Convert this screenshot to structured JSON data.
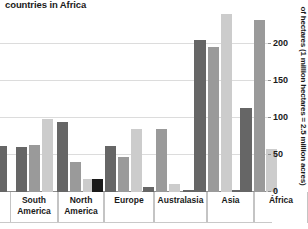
{
  "title": "countries in Africa",
  "y_axis_title": "of hectares (1 million hectares = 2.5 million acres)",
  "y_ticks": [
    "0",
    "50",
    "100",
    "150",
    "200"
  ],
  "categories": [
    "South\nAmerica",
    "North\nAmerica",
    "Europe",
    "Australasia",
    "Asia",
    "África"
  ],
  "colors": {
    "series_1": "#1a1a1a",
    "series_2": "#666666",
    "series_3": "#9a9a9a",
    "series_4": "#cccccc",
    "gridline": "#dcdcdc",
    "baseline": "#8c8c8c",
    "background": "#ffffff",
    "text": "#1a1a1a"
  },
  "chart_data": {
    "type": "bar",
    "title": "countries in Africa",
    "xlabel": "",
    "ylabel": "of hectares (1 million hectares = 2.5 million acres)",
    "ylim": [
      0,
      215
    ],
    "yticks": [
      0,
      50,
      100,
      150,
      200
    ],
    "grid": true,
    "legend": "none",
    "clipped_note": "Chart is cropped: title truncated at top, leftmost bar partially cut off at left edge, tallest Asia and África bars extend beyond top crop.",
    "categories": [
      "South America",
      "North America",
      "Europe",
      "Australasia",
      "Asia",
      "África"
    ],
    "series": [
      {
        "name": "Series 1",
        "color": "#1a1a1a",
        "values": [
          null,
          null,
          18,
          null,
          null,
          null
        ]
      },
      {
        "name": "Series 2",
        "color": "#666666",
        "values": [
          61,
          94,
          62,
          7,
          205,
          113
        ]
      },
      {
        "name": "Series 3",
        "color": "#9a9a9a",
        "values": [
          64,
          40,
          47,
          85,
          196,
          232
        ]
      },
      {
        "name": "Series 4",
        "color": "#cccccc",
        "values": [
          99,
          18,
          85,
          11,
          240,
          58
        ]
      }
    ],
    "bars": [
      {
        "group": "left-clipped",
        "series": "Series 2",
        "value": 62,
        "x": -4,
        "width": 11,
        "color": "#666666"
      },
      {
        "group": "South America",
        "series": "Series 2",
        "value": 61,
        "x": 16,
        "width": 11,
        "color": "#666666"
      },
      {
        "group": "South America",
        "series": "Series 3",
        "value": 64,
        "x": 29,
        "width": 11,
        "color": "#9a9a9a"
      },
      {
        "group": "South America",
        "series": "Series 4",
        "value": 99,
        "x": 42,
        "width": 11,
        "color": "#cccccc"
      },
      {
        "group": "North America",
        "series": "Series 2",
        "value": 94,
        "x": 57,
        "width": 11,
        "color": "#666666"
      },
      {
        "group": "North America",
        "series": "Series 3",
        "value": 40,
        "x": 70,
        "width": 11,
        "color": "#9a9a9a"
      },
      {
        "group": "North America",
        "series": "Series 4",
        "value": 18,
        "x": 83,
        "width": 11,
        "color": "#cccccc"
      },
      {
        "group": "Europe",
        "series": "Series 1",
        "value": 18,
        "x": 92,
        "width": 11,
        "color": "#1a1a1a"
      },
      {
        "group": "Europe",
        "series": "Series 2",
        "value": 62,
        "x": 105,
        "width": 11,
        "color": "#666666"
      },
      {
        "group": "Europe",
        "series": "Series 3",
        "value": 47,
        "x": 118,
        "width": 11,
        "color": "#9a9a9a"
      },
      {
        "group": "Europe",
        "series": "Series 4",
        "value": 85,
        "x": 131,
        "width": 11,
        "color": "#cccccc"
      },
      {
        "group": "Australasia",
        "series": "Series 2",
        "value": 7,
        "x": 143,
        "width": 11,
        "color": "#666666"
      },
      {
        "group": "Australasia",
        "series": "Series 3",
        "value": 85,
        "x": 156,
        "width": 11,
        "color": "#9a9a9a"
      },
      {
        "group": "Australasia",
        "series": "Series 4",
        "value": 11,
        "x": 169,
        "width": 11,
        "color": "#cccccc"
      },
      {
        "group": "Asia",
        "series": "Series 2",
        "value": 3,
        "x": 183,
        "width": 11,
        "color": "#666666"
      },
      {
        "group": "Asia",
        "series": "Series 2b",
        "value": 205,
        "x": 194,
        "width": 12,
        "color": "#666666"
      },
      {
        "group": "Asia",
        "series": "Series 3",
        "value": 196,
        "x": 208,
        "width": 11,
        "color": "#9a9a9a"
      },
      {
        "group": "Asia",
        "series": "Series 4",
        "value": 240,
        "x": 221,
        "width": 11,
        "color": "#cccccc"
      },
      {
        "group": "África",
        "series": "Series 2",
        "value": 3,
        "x": 232,
        "width": 11,
        "color": "#666666"
      },
      {
        "group": "África",
        "series": "Series 2b",
        "value": 113,
        "x": 240,
        "width": 12,
        "color": "#666666"
      },
      {
        "group": "África",
        "series": "Series 3",
        "value": 232,
        "x": 254,
        "width": 11,
        "color": "#9a9a9a"
      },
      {
        "group": "África",
        "series": "Series 4",
        "value": 58,
        "x": 266,
        "width": 11,
        "color": "#cccccc"
      }
    ]
  }
}
